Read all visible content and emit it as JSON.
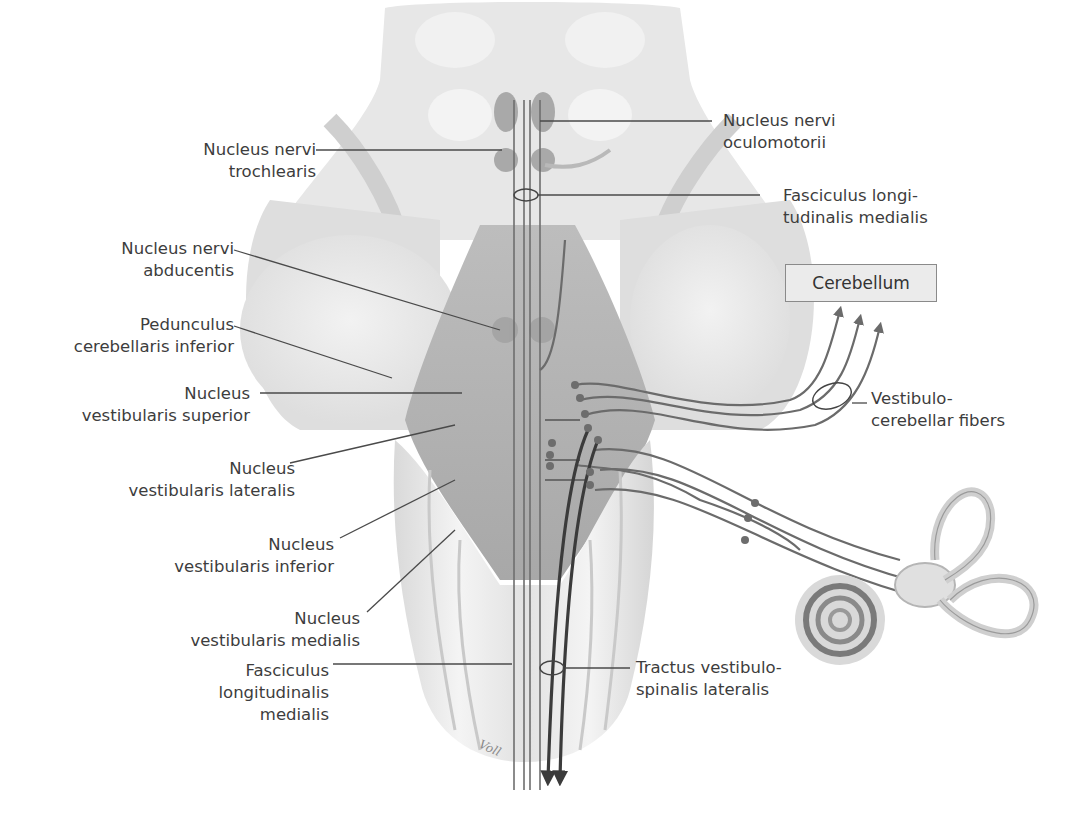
{
  "figure": {
    "signature": "Voll",
    "colors": {
      "background": "#ffffff",
      "text": "#3d3d3d",
      "leader_line": "#4a4a4a",
      "tissue_light": "#e6e6e6",
      "tissue_mid": "#c8c8c8",
      "tissue_dark": "#a9a9a9",
      "fiber": "#6b6b6b",
      "fiber_dark": "#3b3b3b",
      "cerebellum_box_fill": "#ebebeb"
    }
  },
  "labels_left": [
    {
      "id": "nucleus-nervi-trochlearis",
      "lines": [
        "Nucleus nervi",
        "trochlearis"
      ]
    },
    {
      "id": "nucleus-nervi-abducentis",
      "lines": [
        "Nucleus nervi",
        "abducentis"
      ]
    },
    {
      "id": "pedunculus-cerebellaris-inferior",
      "lines": [
        "Pedunculus",
        "cerebellaris inferior"
      ]
    },
    {
      "id": "nucleus-vestibularis-superior",
      "lines": [
        "Nucleus",
        "vestibularis superior"
      ]
    },
    {
      "id": "nucleus-vestibularis-lateralis",
      "lines": [
        "Nucleus",
        "vestibularis lateralis"
      ]
    },
    {
      "id": "nucleus-vestibularis-inferior",
      "lines": [
        "Nucleus",
        "vestibularis inferior"
      ]
    },
    {
      "id": "nucleus-vestibularis-medialis",
      "lines": [
        "Nucleus",
        "vestibularis medialis"
      ]
    },
    {
      "id": "fasciculus-longitudinalis-medialis-bottom",
      "lines": [
        "Fasciculus",
        "longitudinalis",
        "medialis"
      ]
    }
  ],
  "labels_right": [
    {
      "id": "nucleus-nervi-oculomotorii",
      "lines": [
        "Nucleus nervi",
        "oculomotorii"
      ]
    },
    {
      "id": "fasciculus-longitudinalis-medialis-top",
      "lines": [
        "Fasciculus longi-",
        "tudinalis medialis"
      ]
    },
    {
      "id": "vestibulo-cerebellar-fibers",
      "lines": [
        "Vestibulo-",
        "cerebellar fibers"
      ]
    },
    {
      "id": "tractus-vestibulospinalis-lateralis",
      "lines": [
        "Tractus vestibulo-",
        "spinalis lateralis"
      ]
    }
  ],
  "cerebellum_box": {
    "label": "Cerebellum"
  }
}
